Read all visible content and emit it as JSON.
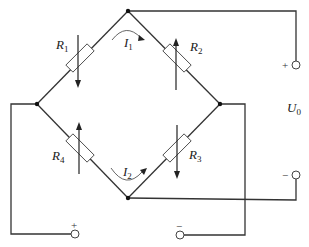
{
  "diagram": {
    "type": "wheatstone-bridge",
    "resistors": [
      {
        "id": "R1",
        "label": "R",
        "sub": "1",
        "arrow": "down"
      },
      {
        "id": "R2",
        "label": "R",
        "sub": "2",
        "arrow": "up"
      },
      {
        "id": "R3",
        "label": "R",
        "sub": "3",
        "arrow": "down"
      },
      {
        "id": "R4",
        "label": "R",
        "sub": "4",
        "arrow": "up"
      }
    ],
    "currents": [
      {
        "id": "I1",
        "label": "I",
        "sub": "1"
      },
      {
        "id": "I2",
        "label": "I",
        "sub": "2"
      }
    ],
    "output": {
      "label": "U",
      "sub": "0",
      "plus": "+",
      "minus": "−"
    },
    "supply": {
      "plus": "+",
      "minus": "−"
    }
  }
}
